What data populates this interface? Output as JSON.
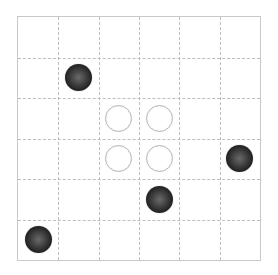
{
  "board": {
    "columns": 6,
    "rows": 6,
    "colors": {
      "grid_line": "#bdbdbd",
      "border": "#c8c8c8",
      "black_stone": "#1a1a1a",
      "white_stone": "#ffffff"
    },
    "stones": [
      {
        "col": 1,
        "row": 1,
        "color": "black"
      },
      {
        "col": 2,
        "row": 2,
        "color": "white"
      },
      {
        "col": 3,
        "row": 2,
        "color": "white"
      },
      {
        "col": 2,
        "row": 3,
        "color": "white"
      },
      {
        "col": 3,
        "row": 3,
        "color": "white"
      },
      {
        "col": 5,
        "row": 3,
        "color": "black"
      },
      {
        "col": 3,
        "row": 4,
        "color": "black"
      },
      {
        "col": 0,
        "row": 5,
        "color": "black"
      }
    ]
  }
}
